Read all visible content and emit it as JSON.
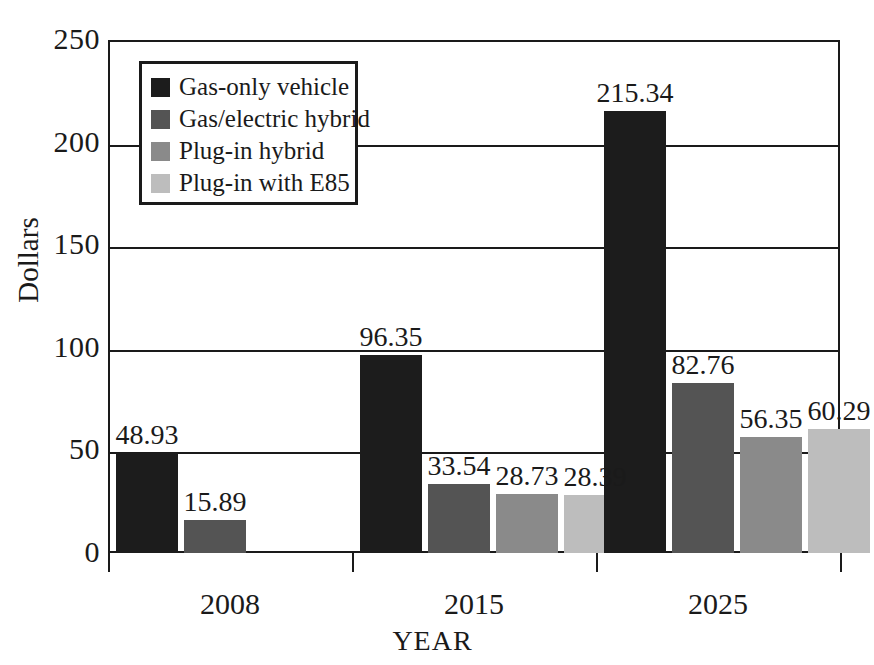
{
  "chart_data": {
    "type": "bar",
    "title": "",
    "xlabel": "YEAR",
    "ylabel": "Dollars",
    "categories": [
      "2008",
      "2015",
      "2025"
    ],
    "ylim": [
      0,
      250
    ],
    "yticks": [
      0,
      50,
      100,
      150,
      200,
      250
    ],
    "ytick_labels": [
      "0",
      "50",
      "100",
      "150",
      "200",
      "250"
    ],
    "grid": true,
    "legend_position": "upper left inside",
    "series": [
      {
        "name": "Gas-only vehicle",
        "color": "#1c1c1c",
        "values": [
          48.93,
          96.35,
          215.34
        ],
        "value_labels": [
          "48.93",
          "96.35",
          "215.34"
        ]
      },
      {
        "name": "Gas/electric hybrid",
        "color": "#545454",
        "values": [
          15.89,
          33.54,
          82.76
        ],
        "value_labels": [
          "15.89",
          "33.54",
          "82.76"
        ]
      },
      {
        "name": "Plug-in hybrid",
        "color": "#8a8a8a",
        "values": [
          null,
          28.73,
          56.35
        ],
        "value_labels": [
          "",
          "28.73",
          "56.35"
        ]
      },
      {
        "name": "Plug-in with E85",
        "color": "#bdbdbd",
        "values": [
          null,
          28.39,
          60.29
        ],
        "value_labels": [
          "",
          "28.39",
          "60.29"
        ]
      }
    ]
  },
  "axis": {
    "y_label": "Dollars",
    "x_label": "YEAR"
  }
}
